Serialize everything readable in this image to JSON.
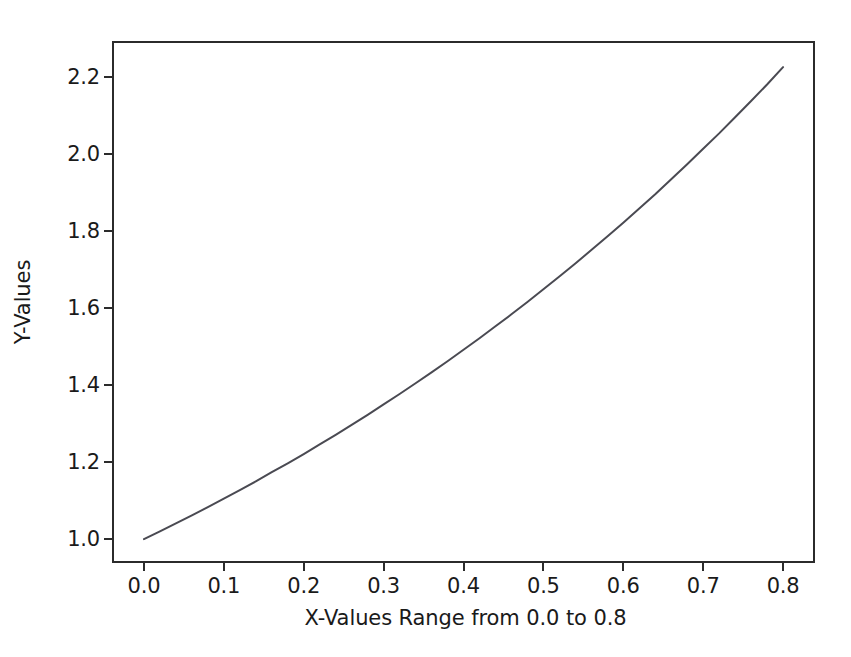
{
  "figure": {
    "background_color": "#ffffff",
    "axes_color": "#2b2b2b",
    "line_color": "#4a4a52",
    "text_color": "#1a1a1a"
  },
  "chart_data": {
    "type": "line",
    "title": "",
    "subtitle": "",
    "xlabel": "X-Values Range from 0.0 to 0.8",
    "ylabel": "Y-Values",
    "xlim": [
      -0.04,
      0.84
    ],
    "ylim": [
      0.938,
      2.294
    ],
    "grid": false,
    "legend": null,
    "xticks": [
      0.0,
      0.1,
      0.2,
      0.3,
      0.4,
      0.5,
      0.6,
      0.7,
      0.8
    ],
    "xtick_labels": [
      "0.0",
      "0.1",
      "0.2",
      "0.3",
      "0.4",
      "0.5",
      "0.6",
      "0.7",
      "0.8"
    ],
    "yticks": [
      1.0,
      1.2,
      1.4,
      1.6,
      1.8,
      2.0,
      2.2
    ],
    "ytick_labels": [
      "1.0",
      "1.2",
      "1.4",
      "1.6",
      "1.8",
      "2.0",
      "2.2"
    ],
    "series": [
      {
        "name": "exp(x)",
        "x": [
          0.0,
          0.02,
          0.04,
          0.06,
          0.08,
          0.1,
          0.12,
          0.14,
          0.16,
          0.18,
          0.2,
          0.22,
          0.24,
          0.26,
          0.28,
          0.3,
          0.32,
          0.34,
          0.36,
          0.38,
          0.4,
          0.42,
          0.44,
          0.46,
          0.48,
          0.5,
          0.52,
          0.54,
          0.56,
          0.58,
          0.6,
          0.62,
          0.64,
          0.66,
          0.68,
          0.7,
          0.72,
          0.74,
          0.76,
          0.78,
          0.8
        ],
        "y": [
          1.0,
          1.02,
          1.041,
          1.062,
          1.083,
          1.105,
          1.127,
          1.15,
          1.174,
          1.197,
          1.221,
          1.246,
          1.271,
          1.297,
          1.323,
          1.35,
          1.377,
          1.405,
          1.433,
          1.462,
          1.492,
          1.522,
          1.553,
          1.584,
          1.616,
          1.649,
          1.682,
          1.716,
          1.751,
          1.786,
          1.822,
          1.859,
          1.896,
          1.935,
          1.974,
          2.014,
          2.054,
          2.096,
          2.138,
          2.181,
          2.226
        ],
        "y_start": 1.0,
        "y_end": 2.226,
        "color": "#4a4a52",
        "linewidth": 2,
        "marker": "none"
      }
    ]
  }
}
